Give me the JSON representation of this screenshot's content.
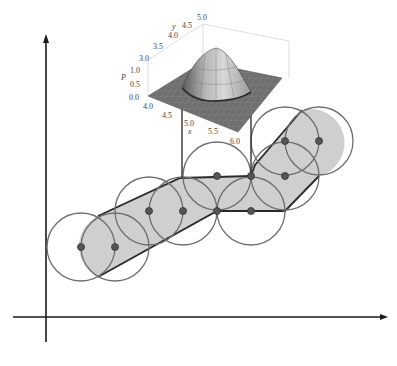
{
  "figure": {
    "colors": {
      "axis": "#1a1a1a",
      "circle": "#6e6e6e",
      "point": "#555555",
      "shade": "#cfcfcf",
      "boundary": "#2a2a2a",
      "surface": "#7a7a7a"
    },
    "main_axes": {
      "x_axis": {
        "from": [
          13,
          317
        ],
        "to": [
          386,
          317
        ]
      },
      "y_axis": {
        "from": [
          46,
          340
        ],
        "to": [
          46,
          35
        ]
      }
    },
    "circle_radius": 34,
    "points": [
      {
        "x": 81,
        "y": 247
      },
      {
        "x": 115,
        "y": 247
      },
      {
        "x": 149,
        "y": 211
      },
      {
        "x": 183,
        "y": 211
      },
      {
        "x": 217,
        "y": 176
      },
      {
        "x": 251,
        "y": 176
      },
      {
        "x": 217,
        "y": 211
      },
      {
        "x": 251,
        "y": 211
      },
      {
        "x": 285,
        "y": 141
      },
      {
        "x": 319,
        "y": 141
      },
      {
        "x": 285,
        "y": 176
      }
    ],
    "inset_3d": {
      "z_label": "P",
      "x_label": "x",
      "y_label": "y",
      "z_ticks": [
        "0.0",
        "0.5",
        "1.0"
      ],
      "x_ticks": [
        "4.0",
        "4.5",
        "5.0",
        "5.5",
        "6.0"
      ],
      "y_ticks": [
        "3.0",
        "3.5",
        "4.0",
        "4.5",
        "5.0"
      ]
    },
    "caption": ""
  }
}
